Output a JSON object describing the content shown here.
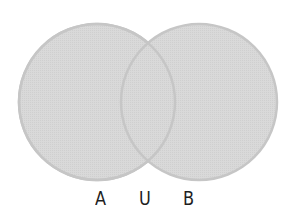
{
  "diagram": {
    "type": "venn",
    "title": "",
    "sets": [
      {
        "id": "A",
        "label": "A",
        "cx": 97,
        "cy": 102,
        "r": 78
      },
      {
        "id": "B",
        "label": "B",
        "cx": 199,
        "cy": 102,
        "r": 78
      }
    ],
    "caption": {
      "left": "A",
      "operator": "U",
      "right": "B"
    },
    "colors": {
      "fill": "#d6d6d6",
      "stroke": "#c4c4c4",
      "background": "#ffffff",
      "text": "#1e1e1e"
    }
  }
}
